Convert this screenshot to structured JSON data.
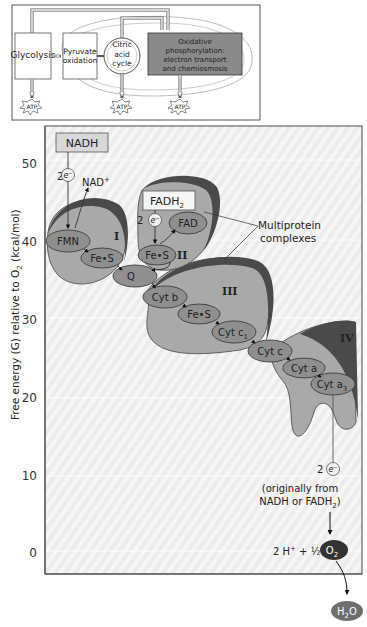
{
  "overview": {
    "stages": [
      {
        "label_lines": [
          "Glycolysis"
        ]
      },
      {
        "label_lines": [
          "Pyruvate",
          "oxidation"
        ]
      },
      {
        "label_lines": [
          "Citric",
          "acid",
          "cycle"
        ]
      },
      {
        "label_lines": [
          "Oxidative",
          "phosphorylation:",
          "electron transport",
          "and chemiosmosis"
        ]
      }
    ],
    "atp_label": "ATP",
    "highlight_color": "#8a8a8a"
  },
  "axis": {
    "label": "Free energy (G) relative to O",
    "label_sub": "2",
    "label_unit": " (kcal/mol)",
    "ticks": [
      "50",
      "40",
      "30",
      "20",
      "10",
      "0"
    ]
  },
  "chain": {
    "nadh": "NADH",
    "nad_plus": "NAD",
    "nad_plus_sup": "+",
    "fadh2": "FADH",
    "fadh2_sub": "2",
    "two": "2",
    "electron": "e",
    "electron_sup": "−",
    "complexes": {
      "I": "I",
      "II": "II",
      "III": "III",
      "IV": "IV"
    },
    "carriers": {
      "fmn": "FMN",
      "fes_1": "Fe•S",
      "fes_2": "Fe•S",
      "fad": "FAD",
      "q": "Q",
      "cyt_b": "Cyt b",
      "fes_3": "Fe•S",
      "cyt_c1": "Cyt c",
      "cyt_c1_sub": "1",
      "cyt_c": "Cyt c",
      "cyt_a": "Cyt a",
      "cyt_a3": "Cyt a",
      "cyt_a3_sub": "3"
    },
    "callout": [
      "Multiprotein",
      "complexes"
    ],
    "origin_note": [
      "(originally from",
      "NADH or FADH"
    ],
    "origin_note_sub": "2",
    "origin_note_close": ")",
    "reaction": "2 H",
    "reaction_sup": "+",
    "reaction_rest": " + ½",
    "o2": "O",
    "o2_sub": "2",
    "h2o_h": "H",
    "h2o_sub": "2",
    "h2o_o": "O"
  },
  "colors": {
    "complex_fill": "#a9a9a9",
    "complex_rim": "#4a4a4a",
    "carrier_fill": "#8f8f8f",
    "panel_bg": "#ececec"
  }
}
